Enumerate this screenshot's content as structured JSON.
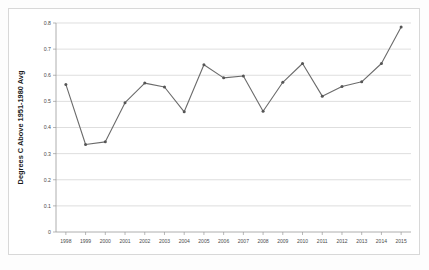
{
  "chart_data": {
    "type": "line",
    "title": "",
    "xlabel": "",
    "ylabel": "Degrees C Above 1951-1980 Avg",
    "categories": [
      "1998",
      "1999",
      "2000",
      "2001",
      "2002",
      "2003",
      "2004",
      "2005",
      "2006",
      "2007",
      "2008",
      "2009",
      "2010",
      "2011",
      "2012",
      "2013",
      "2014",
      "2015"
    ],
    "values": [
      0.565,
      0.335,
      0.345,
      0.495,
      0.57,
      0.555,
      0.46,
      0.64,
      0.59,
      0.597,
      0.462,
      0.573,
      0.645,
      0.52,
      0.557,
      0.575,
      0.645,
      0.785
    ],
    "series": [
      {
        "name": "Global Temperature Anomaly",
        "values": [
          0.565,
          0.335,
          0.345,
          0.495,
          0.57,
          0.555,
          0.46,
          0.64,
          0.59,
          0.597,
          0.462,
          0.573,
          0.645,
          0.52,
          0.557,
          0.575,
          0.645,
          0.785
        ]
      }
    ],
    "ylim": [
      0,
      0.8
    ],
    "ytick_labels": [
      "0",
      "0.1",
      "0.2",
      "0.3",
      "0.4",
      "0.5",
      "0.6",
      "0.7",
      "0.8"
    ],
    "ytick_values": [
      0,
      0.1,
      0.2,
      0.3,
      0.4,
      0.5,
      0.6,
      0.7,
      0.8
    ],
    "grid": true,
    "legend": "none",
    "line_color": "#6b6b6b",
    "marker_color": "#555555",
    "grid_color": "#d0d0d0"
  }
}
